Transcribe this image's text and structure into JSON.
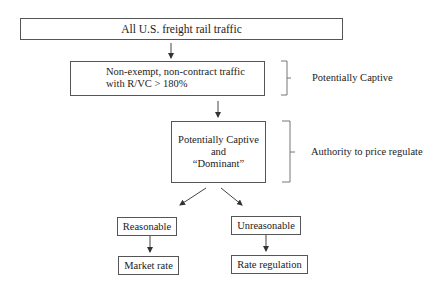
{
  "diagram": {
    "nodes": {
      "all_traffic": "All U.S. freight rail traffic",
      "non_exempt_line1": "Non-exempt, non-contract traffic",
      "non_exempt_line2": "with R/VC > 180%",
      "dominant_line1": "Potentially Captive",
      "dominant_line2": "and",
      "dominant_line3": "“Dominant”",
      "reasonable": "Reasonable",
      "unreasonable": "Unreasonable",
      "market_rate": "Market rate",
      "rate_regulation": "Rate regulation"
    },
    "annotations": {
      "potentially_captive": "Potentially Captive",
      "authority": "Authority to price regulate"
    },
    "edges": [
      {
        "from": "all_traffic",
        "to": "non_exempt"
      },
      {
        "from": "non_exempt",
        "to": "dominant"
      },
      {
        "from": "dominant",
        "to": "reasonable"
      },
      {
        "from": "dominant",
        "to": "unreasonable"
      },
      {
        "from": "reasonable",
        "to": "market_rate"
      },
      {
        "from": "unreasonable",
        "to": "rate_regulation"
      }
    ],
    "colors": {
      "line": "#444444",
      "background": "#ffffff"
    }
  }
}
